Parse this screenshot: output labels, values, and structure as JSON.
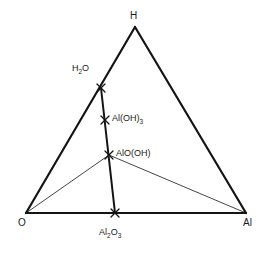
{
  "diagram": {
    "type": "ternary-phase-diagram",
    "title": "",
    "background_color": "#ffffff",
    "line_color": "#141414",
    "text_color": "#1a1a1a",
    "outline_stroke_width": 2.2,
    "join_line_stroke_width": 2.0,
    "tie_line_stroke_width": 0.8,
    "marker_glyph": "x",
    "vertices": [
      {
        "id": "H",
        "label": "H",
        "x": 135,
        "y": 27,
        "label_x": 130,
        "label_y": 11
      },
      {
        "id": "O",
        "label": "O",
        "x": 26,
        "y": 213,
        "label_x": 18,
        "label_y": 218
      },
      {
        "id": "Al",
        "label": "Al",
        "x": 246,
        "y": 213,
        "label_x": 243,
        "label_y": 218
      }
    ],
    "points": [
      {
        "id": "H2O",
        "label_main": "H",
        "label_sub1": "2",
        "label_tail": "O",
        "label_plain": "H2O",
        "x": 101,
        "y": 88,
        "marker": "x",
        "on_edge": "H-O"
      },
      {
        "id": "AlOH3",
        "label_main": "Al(OH)",
        "label_sub1": "3",
        "label_tail": "",
        "label_plain": "Al(OH)3",
        "x": 105,
        "y": 120,
        "marker": "x",
        "on_edge": "join-line"
      },
      {
        "id": "AlOOH",
        "label_main": "AlO(OH)",
        "label_sub1": "",
        "label_tail": "",
        "label_plain": "AlO(OH)",
        "x": 109,
        "y": 155,
        "marker": "x",
        "on_edge": "join-line"
      },
      {
        "id": "Al2O3",
        "label_main": "Al",
        "label_sub1": "2",
        "label_tail": "O",
        "label_sub2": "3",
        "label_plain": "Al2O3",
        "x": 115,
        "y": 213,
        "marker": "x",
        "on_edge": "O-Al"
      }
    ],
    "edges": [
      {
        "id": "edge-H-O",
        "from": "H",
        "to": "O",
        "weight": "thick"
      },
      {
        "id": "edge-H-Al",
        "from": "H",
        "to": "Al",
        "weight": "thick"
      },
      {
        "id": "edge-O-Al",
        "from": "O",
        "to": "Al",
        "weight": "thick"
      }
    ],
    "join_lines": [
      {
        "id": "join-H2O-Al2O3",
        "from": "H2O",
        "to": "Al2O3",
        "weight": "thick"
      }
    ],
    "tie_lines": [
      {
        "id": "tie-AlOOH-O",
        "from": "AlOOH",
        "to": "O",
        "weight": "thin"
      },
      {
        "id": "tie-AlOOH-Al",
        "from": "AlOOH",
        "to": "Al",
        "weight": "thin"
      }
    ]
  }
}
